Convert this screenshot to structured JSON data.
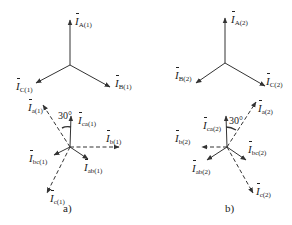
{
  "diagram": {
    "stroke_color": "#333333",
    "top_left": {
      "center": [
        70,
        65
      ],
      "phasors": [
        {
          "name": "A",
          "label_main": "İ",
          "label_sub": "A(1)",
          "to": [
            70,
            20
          ],
          "style": "solid"
        },
        {
          "name": "B",
          "label_main": "İ",
          "label_sub": "B(1)",
          "to": [
            110,
            87
          ],
          "style": "solid"
        },
        {
          "name": "C",
          "label_main": "İ",
          "label_sub": "C(1)",
          "to": [
            36,
            83
          ],
          "style": "solid"
        }
      ]
    },
    "top_right": {
      "center": [
        225,
        63
      ],
      "phasors": [
        {
          "name": "A",
          "label_main": "İ",
          "label_sub": "A(2)",
          "to": [
            225,
            18
          ],
          "style": "solid"
        },
        {
          "name": "B",
          "label_main": "İ",
          "label_sub": "B(2)",
          "to": [
            196,
            83
          ],
          "style": "solid"
        },
        {
          "name": "C",
          "label_main": "İ",
          "label_sub": "C(2)",
          "to": [
            265,
            86
          ],
          "style": "solid"
        }
      ]
    },
    "bottom_left": {
      "caption": "a)",
      "angle_label": "30°",
      "labels": {
        "a": "a(1)",
        "ca": "ca(1)",
        "b": "b(1)",
        "bc": "bc(1)",
        "ab": "ab(1)",
        "c": "c(1)"
      }
    },
    "bottom_right": {
      "caption": "b)",
      "angle_label": "30°",
      "labels": {
        "a": "a(2)",
        "ca": "ca(2)",
        "b": "b(2)",
        "bc": "bc(2)",
        "ab": "ab(2)",
        "c": "c(2)"
      }
    }
  }
}
